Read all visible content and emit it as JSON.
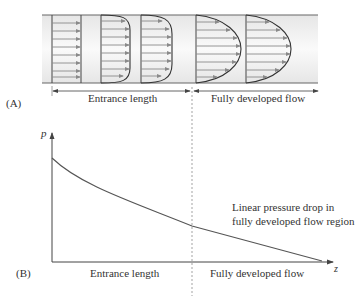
{
  "panel_a": {
    "label": "(A)",
    "entrance_label": "Entrance length",
    "developed_label": "Fully developed flow",
    "profiles": [
      "uniform",
      "developing-1",
      "developing-2",
      "parabolic-1",
      "parabolic-2"
    ]
  },
  "panel_b": {
    "label": "(B)",
    "y_axis": "p",
    "x_axis": "z",
    "entrance_label": "Entrance length",
    "developed_label": "Fully developed flow",
    "annotation_line1": "Linear pressure drop in",
    "annotation_line2": "fully developed flow region"
  },
  "colors": {
    "pipe_fill": "#efefef",
    "line": "#555555",
    "arrow": "#8a8a8a",
    "dashed": "#999999"
  }
}
